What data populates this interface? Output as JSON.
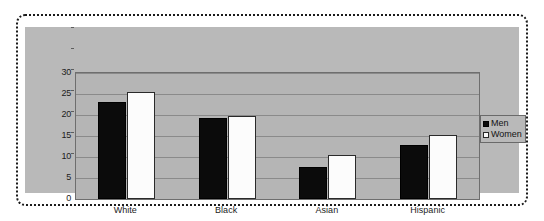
{
  "chart_data": {
    "type": "bar",
    "title": "",
    "subtitle": "",
    "xlabel": "",
    "ylabel": "",
    "categories": [
      "White",
      "Black",
      "Asian",
      "Hispanic"
    ],
    "series": [
      {
        "name": "Men",
        "color": "#0b0b0b",
        "values": [
          23.2,
          19.3,
          7.7,
          12.8
        ]
      },
      {
        "name": "Women",
        "color": "#ffffff",
        "values": [
          25.5,
          19.8,
          10.4,
          15.2
        ]
      }
    ],
    "ylim": [
      0,
      30
    ],
    "ytick_labels": [
      "0",
      "5",
      "10",
      "15",
      "20",
      "25",
      "30"
    ],
    "ytick_values": [
      0,
      5,
      10,
      15,
      20,
      25,
      30
    ],
    "grid": true,
    "legend_position": "top-right-inside",
    "legend_entries": [
      {
        "label": "Men",
        "swatch": "filled-square"
      },
      {
        "label": "Women",
        "swatch": "open-square"
      }
    ],
    "plot_background": "#b5b5b5",
    "canvas_background": "#b9b9b9",
    "gridline_color": "#8a8a8a",
    "axis_color": "#6e6e6e",
    "frame_style": "dotted"
  }
}
